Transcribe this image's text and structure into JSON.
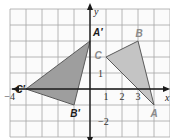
{
  "diagram": {
    "type": "coordinate-plane-reflection",
    "x_range": [
      -5,
      5
    ],
    "y_range": [
      -3,
      5
    ],
    "axis_labels": {
      "x": "x",
      "y": "y"
    },
    "tick_labels": {
      "x": [
        {
          "value": -4,
          "text": "−4"
        },
        {
          "value": 1,
          "text": "1"
        },
        {
          "value": 2,
          "text": "2"
        },
        {
          "value": 3,
          "text": "3"
        }
      ],
      "y": [
        {
          "value": 1,
          "text": "1"
        },
        {
          "value": -2,
          "text": "−2"
        }
      ]
    },
    "colors": {
      "original_fill": "#c4c4c4",
      "image_fill": "#9e9e9e",
      "original_label": "#8a8a8a",
      "image_label": "#1a1a1a"
    },
    "triangles": [
      {
        "name": "original",
        "vertices": [
          {
            "label": "A",
            "x": 4,
            "y": -1
          },
          {
            "label": "B",
            "x": 3,
            "y": 3
          },
          {
            "label": "C",
            "x": 1,
            "y": 2
          }
        ]
      },
      {
        "name": "image",
        "vertices": [
          {
            "label": "A′",
            "x": 0,
            "y": 3
          },
          {
            "label": "B′",
            "x": -1,
            "y": -1
          },
          {
            "label": "C′",
            "x": -4,
            "y": 0
          }
        ]
      }
    ]
  }
}
